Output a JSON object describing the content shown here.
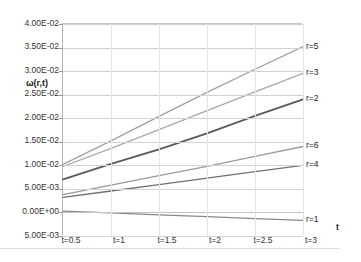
{
  "chart_data": {
    "type": "line",
    "title": "",
    "xlabel": "t",
    "ylabel": "ω(r,t)",
    "x": [
      0.5,
      1,
      1.5,
      2,
      2.5,
      3
    ],
    "x_tick_labels": [
      "t=0.5",
      "t=1",
      "t=1.5",
      "t=2",
      "t=2.5",
      "t=3"
    ],
    "y_tick_labels": [
      "4.00E-02",
      "3.50E-02",
      "3.00E-02",
      "2.50E-02",
      "2.00E-02",
      "1.50E-02",
      "1.00E-02",
      "5.00E-03",
      "0.00E+00",
      "5.00E-03"
    ],
    "y_tick_values": [
      0.04,
      0.035,
      0.03,
      0.025,
      0.02,
      0.015,
      0.01,
      0.005,
      0.0,
      -0.005
    ],
    "ylim": [
      -0.005,
      0.04
    ],
    "xlim": [
      0.5,
      3
    ],
    "grid": true,
    "legend_position": "right-inline",
    "series": [
      {
        "name": "r=5",
        "label": "r=5",
        "color": "#a0a0a0",
        "values": [
          0.0102,
          0.0152,
          0.0204,
          0.0255,
          0.0304,
          0.0352
        ]
      },
      {
        "name": "r=3",
        "label": "r=3",
        "color": "#a8a8a8",
        "values": [
          0.00975,
          0.0136,
          0.0176,
          0.0216,
          0.0256,
          0.0295
        ]
      },
      {
        "name": "r=2",
        "label": "r=2",
        "color": "#5a5a5a",
        "values": [
          0.007,
          0.0103,
          0.0134,
          0.0168,
          0.0205,
          0.024
        ]
      },
      {
        "name": "r=6",
        "label": "r=6",
        "color": "#9a9a9a",
        "values": [
          0.0038,
          0.0058,
          0.0078,
          0.0098,
          0.0119,
          0.014
        ]
      },
      {
        "name": "r=4",
        "label": "r=4",
        "color": "#707070",
        "values": [
          0.0032,
          0.00455,
          0.0059,
          0.0073,
          0.00865,
          0.01
        ]
      },
      {
        "name": "r=1",
        "label": "r=1",
        "color": "#8a8a8a",
        "values": [
          0.0003,
          -0.0001,
          -0.0005,
          -0.0009,
          -0.0013,
          -0.0017
        ]
      }
    ]
  }
}
